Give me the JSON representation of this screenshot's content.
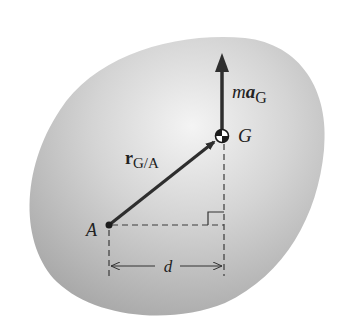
{
  "figure": {
    "body": {
      "fill_center": "#f2f2f2",
      "fill_edge": "#a8a8a8"
    },
    "labels": {
      "force_m": "m",
      "force_a": "a",
      "force_sub": "G",
      "center_of_mass": "G",
      "position_r": "r",
      "position_sub": "G/A",
      "point_a": "A",
      "distance": "d"
    },
    "colors": {
      "vector": "#2e2e2e",
      "dashed": "#3a3a3a",
      "text": "#222222"
    }
  }
}
